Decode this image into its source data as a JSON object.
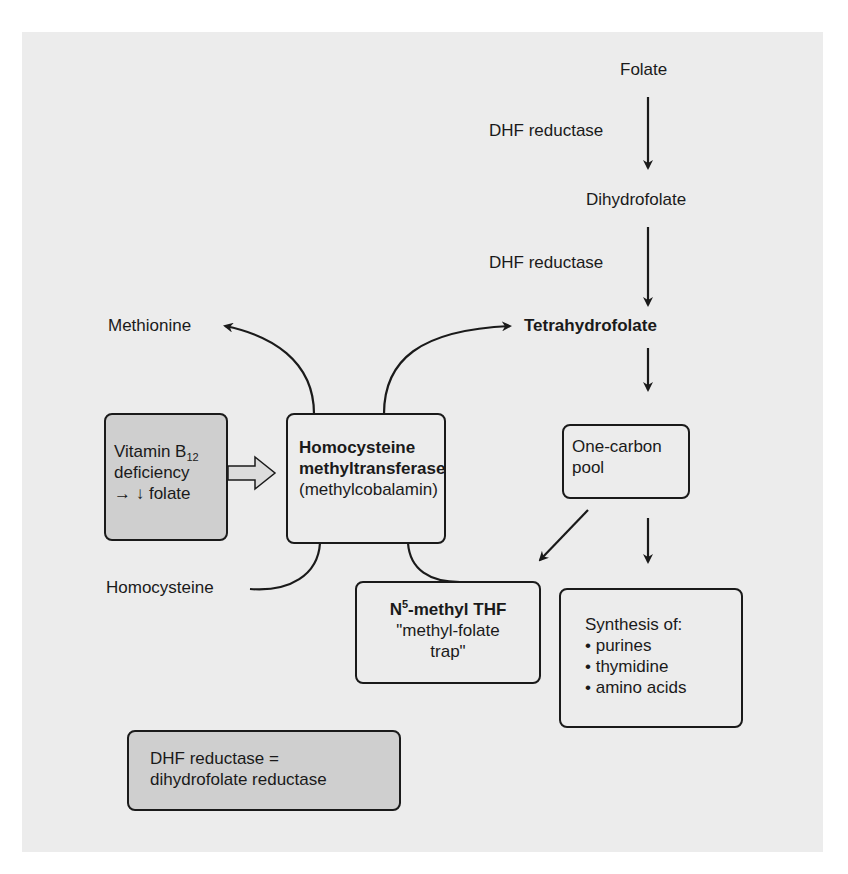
{
  "diagram": {
    "title": "",
    "colors": {
      "panel_bg": "#ececec",
      "shaded_box": "#cfcfcf",
      "stroke": "#1a1a1a"
    },
    "nodes": {
      "folate": "Folate",
      "dhf_reductase_1": "DHF reductase",
      "dihydrofolate": "Dihydrofolate",
      "dhf_reductase_2": "DHF reductase",
      "tetrahydrofolate": "Tetrahydrofolate",
      "methionine": "Methionine",
      "homocysteine": "Homocysteine",
      "b12_box": {
        "line1": "Vitamin B",
        "line1_sub": "12",
        "line2": "deficiency",
        "line3": "→ ↓ folate"
      },
      "enzyme_box": {
        "line1": "Homocysteine",
        "line2": "methyltransferase",
        "line3": "(methylcobalamin)"
      },
      "one_carbon_box": {
        "line1": "One-carbon",
        "line2": "pool"
      },
      "n5_box": {
        "line1_pre": "N",
        "line1_sup": "5",
        "line1_post": "-methyl THF",
        "line2": "\"methyl-folate",
        "line3": "trap\""
      },
      "synthesis_box": {
        "title": "Synthesis of:",
        "items": [
          "• purines",
          "• thymidine",
          "• amino acids"
        ]
      },
      "legend_box": {
        "line1": "DHF reductase =",
        "line2": "dihydrofolate reductase"
      }
    },
    "edges": [
      {
        "from": "Folate",
        "to": "Dihydrofolate",
        "label": "DHF reductase"
      },
      {
        "from": "Dihydrofolate",
        "to": "Tetrahydrofolate",
        "label": "DHF reductase"
      },
      {
        "from": "Tetrahydrofolate",
        "to": "One-carbon pool"
      },
      {
        "from": "One-carbon pool",
        "to": "N5-methyl THF"
      },
      {
        "from": "One-carbon pool",
        "to": "Synthesis of"
      },
      {
        "from": "N5-methyl THF",
        "to": "Tetrahydrofolate",
        "via": "Homocysteine methyltransferase"
      },
      {
        "from": "Homocysteine",
        "to": "Methionine",
        "via": "Homocysteine methyltransferase"
      },
      {
        "from": "Vitamin B12 deficiency",
        "to": "Homocysteine methyltransferase",
        "style": "hollow-arrow"
      }
    ]
  }
}
